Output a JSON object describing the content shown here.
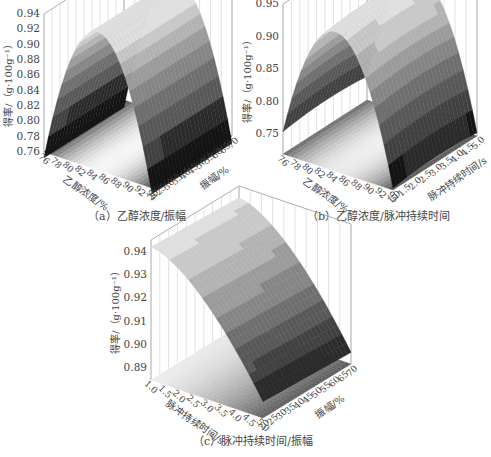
{
  "captions": {
    "a": "（a）乙醇浓度/振幅",
    "b": "（b）乙醇浓度/脉冲持续时间",
    "c": "（c）脉冲持续时间/振幅"
  },
  "chart_data": [
    {
      "type": "surface3d",
      "title": "（a）乙醇浓度/振幅",
      "zlabel": "得率/（g·100g⁻¹）",
      "xlabel": "乙醇浓度/%",
      "ylabel": "振幅/%",
      "z_ticks": [
        "0.76",
        "0.78",
        "0.80",
        "0.82",
        "0.84",
        "0.86",
        "0.88",
        "0.90",
        "0.92",
        "0.94"
      ],
      "x_ticks": [
        "76",
        "78",
        "80",
        "82",
        "84",
        "86",
        "88",
        "90",
        "92",
        "94"
      ],
      "y_ticks": [
        "20",
        "25",
        "30",
        "35",
        "40",
        "45",
        "50",
        "55",
        "60",
        "65",
        "70"
      ],
      "zlim": [
        0.76,
        0.94
      ],
      "description": "Parabolic ridge along ethanol concentration peaking ~0.94 near 84-86%; surface nearly flat along amplitude",
      "colormap": "grayscale"
    },
    {
      "type": "surface3d",
      "title": "（b）乙醇浓度/脉冲持续时间",
      "zlabel": "得率/（g·100g⁻¹）",
      "xlabel": "乙醇浓度/%",
      "ylabel": "脉冲持续时间/s",
      "z_ticks": [
        "0.75",
        "0.80",
        "0.85",
        "0.90",
        "0.95"
      ],
      "x_ticks": [
        "76",
        "78",
        "80",
        "82",
        "84",
        "86",
        "88",
        "90",
        "92",
        "94"
      ],
      "y_ticks": [
        "1.0",
        "1.5",
        "2.0",
        "2.5",
        "3.0",
        "3.5",
        "4.0",
        "4.5",
        "5.0"
      ],
      "zlim": [
        0.72,
        0.95
      ],
      "description": "Parabolic ridge along ethanol concentration peaking ~0.94; slight curvature along pulse duration",
      "colormap": "grayscale"
    },
    {
      "type": "surface3d",
      "title": "（c）脉冲持续时间/振幅",
      "zlabel": "得率/（g·100g⁻¹）",
      "xlabel": "脉冲持续时间/s",
      "ylabel": "振幅/%",
      "z_ticks": [
        "0.89",
        "0.90",
        "0.91",
        "0.92",
        "0.93",
        "0.94"
      ],
      "x_ticks": [
        "1.0",
        "1.5",
        "2.0",
        "2.5",
        "3.0",
        "3.5",
        "4.0",
        "4.5",
        "5.0"
      ],
      "y_ticks": [
        "20",
        "25",
        "30",
        "35",
        "40",
        "45",
        "50",
        "55",
        "60",
        "65",
        "70"
      ],
      "zlim": [
        0.885,
        0.945
      ],
      "description": "Yield highest (~0.94) at short pulse duration, decreasing toward ~0.89 at 5.0 s; nearly flat along amplitude",
      "colormap": "grayscale"
    }
  ]
}
